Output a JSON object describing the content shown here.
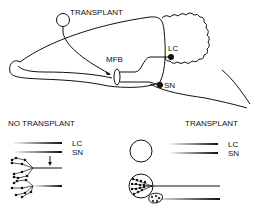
{
  "top": {
    "transplant_label": "TRANSPLANT",
    "mfb_label": "MFB",
    "lc_label": "LC",
    "sn_label": "SN"
  },
  "bottom_left": {
    "title": "NO TRANSPLANT",
    "lc_label": "LC",
    "sn_label": "SN"
  },
  "bottom_right": {
    "title": "TRANSPLANT",
    "lc_label": "LC",
    "sn_label": "SN"
  },
  "colors": {
    "ink": "#111111",
    "background": "#ffffff"
  }
}
